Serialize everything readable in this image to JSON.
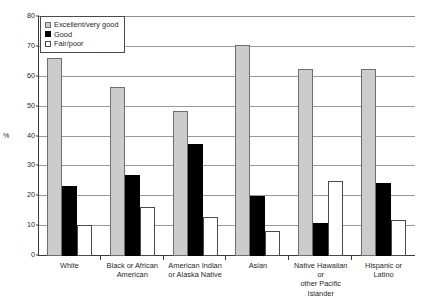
{
  "chart_data": {
    "type": "bar",
    "title": "",
    "xlabel": "",
    "ylabel": "%",
    "ylim": [
      0,
      80
    ],
    "yticks": [
      0,
      10,
      20,
      30,
      40,
      50,
      60,
      70,
      80
    ],
    "grid": true,
    "legend_position": "top-left",
    "categories": [
      "White",
      "Black or African American",
      "American Indian or Alaska Native",
      "Asian",
      "Native Hawaiian or other Pacific Islander",
      "Hispanic or Latino"
    ],
    "category_lines": [
      [
        "White"
      ],
      [
        "Black or African",
        "American"
      ],
      [
        "American Indian",
        "or Alaska Native"
      ],
      [
        "Asian"
      ],
      [
        "Native Hawaiian or",
        "other Pacific Islander"
      ],
      [
        "Hispanic or",
        "Latino"
      ]
    ],
    "series": [
      {
        "name": "Excellent/very good",
        "color": "#cccccc",
        "values": [
          66,
          56.5,
          48.5,
          70.5,
          62.5,
          62.5
        ]
      },
      {
        "name": "Good",
        "color": "#000000",
        "values": [
          23.5,
          27,
          37.5,
          20,
          11,
          24.5
        ]
      },
      {
        "name": "Fair/poor",
        "color": "#ffffff",
        "values": [
          10.5,
          16.5,
          13,
          8.5,
          25,
          12
        ]
      }
    ]
  },
  "axis": {
    "y_label": "%",
    "tick_labels": [
      "0",
      "10",
      "20",
      "30",
      "40",
      "50",
      "60",
      "70",
      "80"
    ]
  },
  "legend": {
    "items": [
      {
        "label": "Excellent/very good",
        "swatch": "series-excellent"
      },
      {
        "label": "Good",
        "swatch": "series-good"
      },
      {
        "label": "Fair/poor",
        "swatch": "series-fair"
      }
    ]
  },
  "caption": {
    "text": ""
  }
}
